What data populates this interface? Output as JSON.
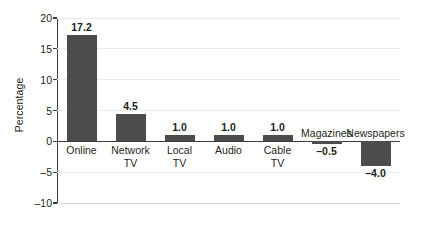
{
  "chart_data": {
    "type": "bar",
    "title": "",
    "xlabel": "",
    "ylabel": "Percentage",
    "ylim": [
      -10,
      20
    ],
    "yticks": [
      20,
      15,
      10,
      5,
      0,
      -5,
      -10
    ],
    "ytick_labels": [
      "20",
      "15",
      "10",
      "5",
      "0",
      "–5",
      "–10"
    ],
    "grid": true,
    "legend": "none",
    "categories": [
      "Online",
      "Network TV",
      "Local TV",
      "Audio",
      "Cable TV",
      "Magazines",
      "Newspapers"
    ],
    "values": [
      17.2,
      4.5,
      1.0,
      1.0,
      1.0,
      -0.5,
      -4.0
    ],
    "value_labels": [
      "17.2",
      "4.5",
      "1.0",
      "1.0",
      "1.0",
      "–0.5",
      "–4.0"
    ],
    "bars": [
      {
        "category": "Online",
        "category_lines": [
          "Online"
        ],
        "value": 17.2,
        "value_label": "17.2"
      },
      {
        "category": "Network TV",
        "category_lines": [
          "Network",
          "TV"
        ],
        "value": 4.5,
        "value_label": "4.5"
      },
      {
        "category": "Local TV",
        "category_lines": [
          "Local",
          "TV"
        ],
        "value": 1.0,
        "value_label": "1.0"
      },
      {
        "category": "Audio",
        "category_lines": [
          "Audio"
        ],
        "value": 1.0,
        "value_label": "1.0"
      },
      {
        "category": "Cable TV",
        "category_lines": [
          "Cable",
          "TV"
        ],
        "value": 1.0,
        "value_label": "1.0"
      },
      {
        "category": "Magazines",
        "category_lines": [
          "Magazines"
        ],
        "value": -0.5,
        "value_label": "–0.5"
      },
      {
        "category": "Newspapers",
        "category_lines": [
          "Newspapers"
        ],
        "value": -4.0,
        "value_label": "–4.0"
      }
    ],
    "colors": {
      "bar": "#4c4c4c",
      "gridline": "#ececec",
      "axis": "#3b3b3b",
      "text": "#231f20",
      "background": "#ffffff"
    }
  }
}
